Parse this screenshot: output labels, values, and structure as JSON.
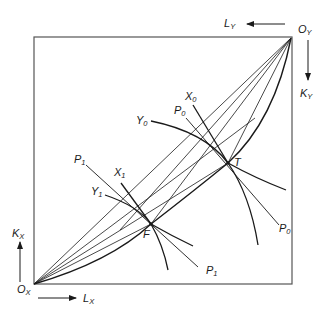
{
  "diagram": {
    "type": "edgeworth-box",
    "colors": {
      "line": "#1a1a1a",
      "frame": "#555555",
      "background": "#ffffff"
    },
    "origins": {
      "x": {
        "label": "O",
        "sub": "X"
      },
      "y": {
        "label": "O",
        "sub": "Y"
      }
    },
    "axes": {
      "labor_x": {
        "label": "L",
        "sub": "X"
      },
      "capital_x": {
        "label": "K",
        "sub": "X"
      },
      "labor_y": {
        "label": "L",
        "sub": "Y"
      },
      "capital_y": {
        "label": "K",
        "sub": "Y"
      }
    },
    "points": {
      "T": {
        "label": "T"
      },
      "F": {
        "label": "F"
      }
    },
    "isoquants": {
      "X0": {
        "label": "X",
        "sub": "0"
      },
      "X1": {
        "label": "X",
        "sub": "1"
      },
      "Y0": {
        "label": "Y",
        "sub": "0"
      },
      "Y1": {
        "label": "Y",
        "sub": "1"
      }
    },
    "price_lines": {
      "P0_upper": {
        "label": "P",
        "sub": "0"
      },
      "P0_lower": {
        "label": "P",
        "sub": "0"
      },
      "P1_upper": {
        "label": "P",
        "sub": "1"
      },
      "P1_lower": {
        "label": "P",
        "sub": "1"
      }
    }
  }
}
